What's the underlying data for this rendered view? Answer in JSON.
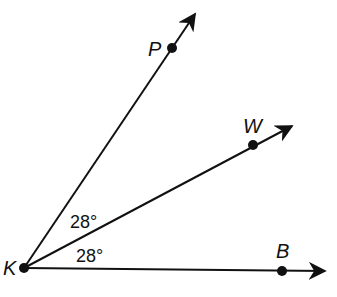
{
  "diagram": {
    "vertex": {
      "label": "K",
      "x": 24,
      "y": 268
    },
    "rays": [
      {
        "name": "ray-KP",
        "point_label": "P",
        "point": [
          172,
          48
        ],
        "tip": [
          195,
          14
        ],
        "label_pos": [
          148,
          56
        ]
      },
      {
        "name": "ray-KW",
        "point_label": "W",
        "point": [
          253,
          145
        ],
        "tip": [
          292,
          126
        ],
        "label_pos": [
          243,
          133
        ]
      },
      {
        "name": "ray-KB",
        "point_label": "B",
        "point": [
          282,
          271
        ],
        "tip": [
          325,
          271
        ],
        "label_pos": [
          276,
          258
        ]
      }
    ],
    "angles": [
      {
        "label": "28°",
        "between": "P-K-W",
        "pos": [
          70,
          228
        ]
      },
      {
        "label": "28°",
        "between": "W-K-B",
        "pos": [
          76,
          262
        ]
      }
    ],
    "colors": {
      "line": "#111111",
      "background": "#ffffff"
    }
  }
}
